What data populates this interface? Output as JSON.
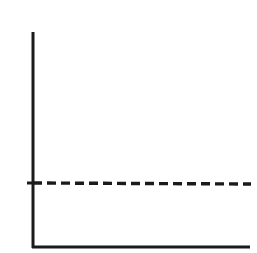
{
  "chart_data": {
    "type": "line",
    "title": "",
    "subtitle": "",
    "xlabel": "",
    "ylabel": "",
    "xlim": [
      0,
      100
    ],
    "ylim": [
      0,
      100
    ],
    "grid": false,
    "legend": null,
    "xticks": [],
    "yticks": [
      30
    ],
    "xticklabels": [],
    "yticklabels": [
      ""
    ],
    "annotations": [],
    "series": [
      {
        "name": "constant-level",
        "style": "dashed",
        "color": "#1a1a1a",
        "linewidth": 3,
        "x": [
          0,
          100
        ],
        "values": [
          30,
          29.5
        ]
      }
    ]
  },
  "figure": {
    "background": "#ffffff",
    "axis_color": "#1a1a1a",
    "axis_linewidth": 3,
    "width": 257,
    "height": 253
  },
  "axes": {
    "y_axis": {
      "x": 33,
      "y_top": 32,
      "y_bottom": 248
    },
    "x_axis": {
      "y": 247,
      "x_left": 32,
      "x_right": 250
    },
    "y_tick": {
      "y": 183,
      "x_start": 27,
      "x_end": 33
    }
  },
  "dashed_line": {
    "y_start": 183,
    "y_end": 184,
    "x_start": 33,
    "x_end": 251,
    "dash_length": 9,
    "gap_length": 5,
    "color": "#1a1a1a",
    "linewidth": 3.4
  },
  "accessibility": {
    "description": "Line chart with a horizontal dashed line at a constant level",
    "y_axis_name": "vertical axis",
    "x_axis_name": "horizontal axis",
    "series_name": "constant dashed level line"
  }
}
